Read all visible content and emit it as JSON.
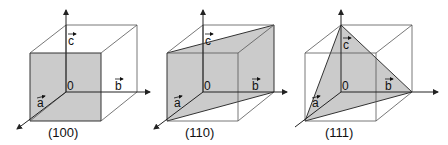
{
  "figure": {
    "panels": [
      {
        "id": "p100",
        "caption": "(100)",
        "plane": "100",
        "dx": 0
      },
      {
        "id": "p110",
        "caption": "(110)",
        "plane": "110",
        "dx": 137
      },
      {
        "id": "p111",
        "caption": "(111)",
        "plane": "111",
        "dx": 275
      }
    ],
    "axis_labels": {
      "a": "a",
      "b": "b",
      "c": "c",
      "origin": "0"
    },
    "colors": {
      "plane_fill": "#c8c8c8",
      "edge": "#555555",
      "axis": "#222222"
    }
  }
}
